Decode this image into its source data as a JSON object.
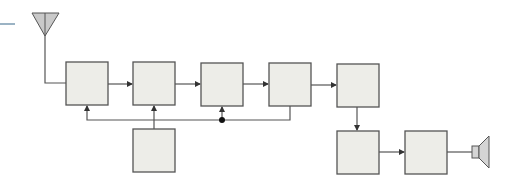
{
  "diagram": {
    "type": "block-diagram",
    "colors": {
      "block_fill": "#ededE8",
      "block_stroke": "#555555",
      "line": "#555555",
      "antenna_fill": "#c9c9c9",
      "speaker_fill": "#d4d4d4",
      "accent_rule": "#7a9ab0"
    },
    "blocks": [
      {
        "id": "block-1",
        "x": 66,
        "y": 62,
        "w": 42,
        "h": 43,
        "label": ""
      },
      {
        "id": "block-2",
        "x": 133,
        "y": 62,
        "w": 42,
        "h": 43,
        "label": ""
      },
      {
        "id": "block-3",
        "x": 201,
        "y": 63,
        "w": 42,
        "h": 43,
        "label": ""
      },
      {
        "id": "block-4",
        "x": 269,
        "y": 63,
        "w": 42,
        "h": 43,
        "label": ""
      },
      {
        "id": "block-5",
        "x": 337,
        "y": 64,
        "w": 42,
        "h": 43,
        "label": ""
      },
      {
        "id": "block-6",
        "x": 133,
        "y": 129,
        "w": 42,
        "h": 43,
        "label": ""
      },
      {
        "id": "block-7",
        "x": 337,
        "y": 131,
        "w": 42,
        "h": 43,
        "label": ""
      },
      {
        "id": "block-8",
        "x": 405,
        "y": 131,
        "w": 42,
        "h": 43,
        "label": ""
      }
    ],
    "components": [
      {
        "id": "antenna",
        "kind": "antenna"
      },
      {
        "id": "speaker",
        "kind": "loudspeaker"
      }
    ]
  }
}
